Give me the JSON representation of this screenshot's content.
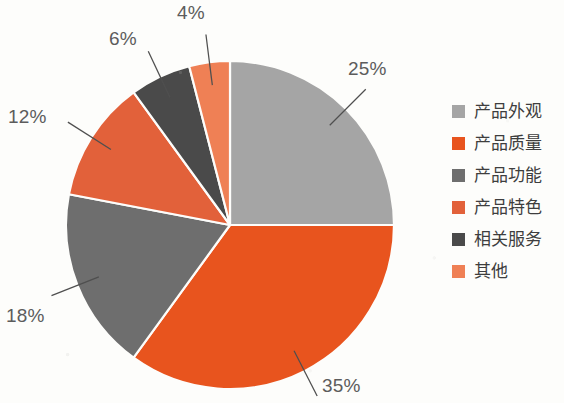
{
  "chart_data": {
    "type": "pie",
    "title": "",
    "categories": [
      "产品外观",
      "产品质量",
      "产品功能",
      "产品特色",
      "相关服务",
      "其他"
    ],
    "values": [
      25,
      35,
      18,
      12,
      6,
      4
    ],
    "value_labels": [
      "25%",
      "35%",
      "18%",
      "12%",
      "6%",
      "4%"
    ],
    "unit": "%",
    "total": 100,
    "start_angle_deg": 0,
    "direction": "clockwise",
    "legend_position": "right",
    "grid": false,
    "colors": [
      "#a5a5a5",
      "#e8541e",
      "#6e6e6e",
      "#e2613a",
      "#4a4a4a",
      "#ef8055"
    ],
    "slices": [
      {
        "label": "产品外观",
        "value": 25,
        "value_label": "25%",
        "color": "#a5a5a5",
        "callout_x": 348,
        "callout_y": 58,
        "anchor": "start"
      },
      {
        "label": "产品质量",
        "value": 35,
        "value_label": "35%",
        "color": "#e8541e",
        "callout_x": 322,
        "callout_y": 375,
        "anchor": "start"
      },
      {
        "label": "产品功能",
        "value": 18,
        "value_label": "18%",
        "color": "#6e6e6e",
        "callout_x": 6,
        "callout_y": 305,
        "anchor": "start"
      },
      {
        "label": "产品特色",
        "value": 12,
        "value_label": "12%",
        "color": "#e2613a",
        "callout_x": 8,
        "callout_y": 106,
        "anchor": "start"
      },
      {
        "label": "相关服务",
        "value": 6,
        "value_label": "6%",
        "color": "#4a4a4a",
        "callout_x": 109,
        "callout_y": 28,
        "anchor": "start"
      },
      {
        "label": "其他",
        "value": 4,
        "value_label": "4%",
        "color": "#ef8055",
        "callout_x": 177,
        "callout_y": 2,
        "anchor": "start"
      }
    ],
    "geometry": {
      "cx": 230,
      "cy": 225,
      "r": 164
    }
  },
  "legend": {
    "items": [
      {
        "label": "产品外观",
        "color": "#a5a5a5"
      },
      {
        "label": "产品质量",
        "color": "#e8541e"
      },
      {
        "label": "产品功能",
        "color": "#6e6e6e"
      },
      {
        "label": "产品特色",
        "color": "#e2613a"
      },
      {
        "label": "相关服务",
        "color": "#4a4a4a"
      },
      {
        "label": "其他",
        "color": "#ef8055"
      }
    ]
  }
}
